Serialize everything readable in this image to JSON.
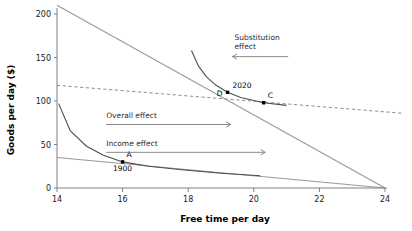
{
  "chart_data": {
    "type": "line",
    "title": "",
    "xlabel": "Free time per day",
    "ylabel": "Goods per day ($)",
    "xlim": [
      14,
      24
    ],
    "ylim": [
      0,
      200
    ],
    "xticks": [
      14,
      16,
      18,
      20,
      22,
      24
    ],
    "yticks": [
      0,
      50,
      100,
      150,
      200
    ],
    "grid": false,
    "legend": "none",
    "series": [
      {
        "name": "budget-constraint-1900",
        "style": "solid",
        "color": "#9a9a9a",
        "x": [
          14,
          24
        ],
        "y": [
          35,
          0
        ]
      },
      {
        "name": "budget-constraint-2020",
        "style": "solid",
        "color": "#9a9a9a",
        "x": [
          14,
          24
        ],
        "y": [
          210,
          0
        ]
      },
      {
        "name": "hypothetical-budget-line",
        "style": "dashed",
        "color": "#8e8e8e",
        "x": [
          14,
          24.5
        ],
        "y": [
          118,
          86
        ]
      },
      {
        "name": "indifference-curve-1900",
        "style": "solid",
        "color": "#4d4d4d",
        "x": [
          14.05,
          14.4,
          14.9,
          15.4,
          16.0,
          16.8,
          17.8,
          19.0,
          20.2
        ],
        "y": [
          97,
          66,
          48,
          38,
          30,
          25,
          21,
          17,
          14
        ]
      },
      {
        "name": "indifference-curve-2020",
        "style": "solid",
        "color": "#4d4d4d",
        "x": [
          18.1,
          18.3,
          18.55,
          18.85,
          19.2,
          19.6,
          20.3,
          21.0
        ],
        "y": [
          158,
          141,
          128,
          118,
          110,
          104,
          98,
          95
        ]
      }
    ],
    "points": [
      {
        "label": "A",
        "year_label": "1900",
        "x": 16.0,
        "y": 30
      },
      {
        "label": "C",
        "year_label": "",
        "x": 20.3,
        "y": 98
      },
      {
        "label": "D",
        "year_label": "2020",
        "x": 19.2,
        "y": 110
      }
    ],
    "annotations": [
      {
        "name": "substitution-effect",
        "text_line1": "Substitution",
        "text_line2": "effect",
        "direction": "left",
        "arrow_from_x": 21.05,
        "arrow_to_x": 19.35,
        "arrow_y": 151
      },
      {
        "name": "overall-effect",
        "text_line1": "Overall effect",
        "text_line2": "",
        "direction": "right",
        "arrow_from_x": 15.5,
        "arrow_to_x": 19.3,
        "arrow_y": 73
      },
      {
        "name": "income-effect",
        "text_line1": "Income effect",
        "text_line2": "",
        "direction": "right",
        "arrow_from_x": 15.5,
        "arrow_to_x": 20.35,
        "arrow_y": 41
      }
    ]
  }
}
